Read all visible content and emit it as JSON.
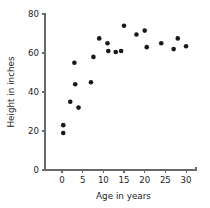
{
  "chart_data": {
    "type": "scatter",
    "title": "",
    "xlabel": "Age in years",
    "ylabel": "Height in inches",
    "xlim": [
      -2.5,
      33.5
    ],
    "ylim": [
      0,
      82
    ],
    "xticks": [
      0,
      5,
      10,
      15,
      20,
      25,
      30
    ],
    "xticklabels": [
      "0",
      "5",
      "10",
      "15",
      "20",
      "25",
      "30"
    ],
    "yticks": [
      0,
      20,
      40,
      60,
      80
    ],
    "yticklabels": [
      "0",
      "20",
      "40",
      "60",
      "80"
    ],
    "grid": false,
    "legend": null,
    "marker": "filled-circle",
    "marker_color": "#191919",
    "marker_size_px": 4.6,
    "points": [
      {
        "x": 0.3,
        "y": 23
      },
      {
        "x": 0.3,
        "y": 19
      },
      {
        "x": 2.0,
        "y": 35
      },
      {
        "x": 3.0,
        "y": 55
      },
      {
        "x": 3.2,
        "y": 44
      },
      {
        "x": 4.0,
        "y": 32
      },
      {
        "x": 7.0,
        "y": 45
      },
      {
        "x": 7.6,
        "y": 58
      },
      {
        "x": 9.0,
        "y": 67.5
      },
      {
        "x": 11.0,
        "y": 65
      },
      {
        "x": 11.2,
        "y": 61
      },
      {
        "x": 13.0,
        "y": 60.5
      },
      {
        "x": 14.3,
        "y": 61
      },
      {
        "x": 15.0,
        "y": 74
      },
      {
        "x": 18.0,
        "y": 69.5
      },
      {
        "x": 20.0,
        "y": 71.5
      },
      {
        "x": 20.5,
        "y": 63
      },
      {
        "x": 24.0,
        "y": 65
      },
      {
        "x": 27.0,
        "y": 62
      },
      {
        "x": 28.0,
        "y": 67.5
      },
      {
        "x": 30.0,
        "y": 63.5
      }
    ],
    "x_values": [
      0.3,
      0.3,
      2.0,
      3.0,
      3.2,
      4.0,
      7.0,
      7.6,
      9.0,
      11.0,
      11.2,
      13.0,
      14.3,
      15.0,
      18.0,
      20.0,
      20.5,
      24.0,
      27.0,
      28.0,
      30.0
    ],
    "y_values": [
      23,
      19,
      35,
      55,
      44,
      32,
      45,
      58,
      67.5,
      65,
      61,
      60.5,
      61,
      74,
      69.5,
      71.5,
      63,
      65,
      62,
      67.5,
      63.5
    ],
    "axis_color": "#6a6a6a",
    "text_color": "#1d1d1d",
    "background": "#ffffff"
  }
}
